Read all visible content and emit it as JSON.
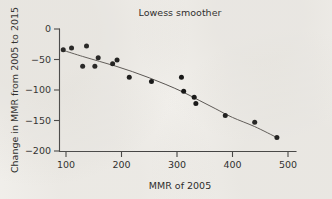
{
  "chart_data": {
    "type": "scatter",
    "title": "Lowess smoother",
    "xlabel": "MMR of 2005",
    "ylabel": "Change in MMR from 2005 to 2015",
    "xlim": [
      80,
      500
    ],
    "ylim": [
      -205,
      3
    ],
    "xticks": [
      100,
      200,
      300,
      400,
      500
    ],
    "yticks": [
      0,
      -50,
      -100,
      -150,
      -200
    ],
    "xtick_labels": [
      "100",
      "200",
      "300",
      "400",
      "500"
    ],
    "ytick_labels": [
      "0",
      "-50",
      "-100",
      "-150",
      "-200"
    ],
    "grid": false,
    "legend": null,
    "series": [
      {
        "name": "Countries",
        "marker": "filled-circle",
        "color": "#101010",
        "points": [
          {
            "x": 95,
            "y": -34
          },
          {
            "x": 110,
            "y": -31
          },
          {
            "x": 130,
            "y": -61
          },
          {
            "x": 137,
            "y": -28
          },
          {
            "x": 152,
            "y": -61
          },
          {
            "x": 158,
            "y": -47
          },
          {
            "x": 184,
            "y": -57
          },
          {
            "x": 192,
            "y": -51
          },
          {
            "x": 214,
            "y": -79
          },
          {
            "x": 254,
            "y": -86
          },
          {
            "x": 308,
            "y": -79
          },
          {
            "x": 312,
            "y": -102
          },
          {
            "x": 331,
            "y": -112
          },
          {
            "x": 334,
            "y": -122
          },
          {
            "x": 387,
            "y": -142
          },
          {
            "x": 440,
            "y": -153
          },
          {
            "x": 480,
            "y": -178
          }
        ]
      },
      {
        "name": "Lowess smoother",
        "marker": "line",
        "color": "#55514e",
        "points": [
          {
            "x": 95,
            "y": -35
          },
          {
            "x": 130,
            "y": -45
          },
          {
            "x": 160,
            "y": -53
          },
          {
            "x": 190,
            "y": -61
          },
          {
            "x": 220,
            "y": -70
          },
          {
            "x": 250,
            "y": -80
          },
          {
            "x": 280,
            "y": -91
          },
          {
            "x": 310,
            "y": -103
          },
          {
            "x": 340,
            "y": -117
          },
          {
            "x": 370,
            "y": -131
          },
          {
            "x": 400,
            "y": -145
          },
          {
            "x": 440,
            "y": -160
          },
          {
            "x": 480,
            "y": -178
          }
        ]
      }
    ]
  }
}
